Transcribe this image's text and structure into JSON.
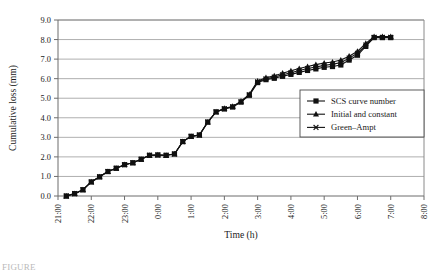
{
  "chart_data": {
    "type": "line",
    "title": "",
    "xlabel": "Time (h)",
    "ylabel": "Cumulative loss (mm)",
    "xlim": [
      0,
      11
    ],
    "ylim": [
      0,
      9
    ],
    "grid": true,
    "legend_position": "center-right",
    "x_tick_labels": [
      "21:00",
      "22:00",
      "23:00",
      "0:00",
      "1:00",
      "2:00",
      "3:00",
      "4:00",
      "5:00",
      "6:00",
      "7:00",
      "8:00"
    ],
    "x_tick_values": [
      0,
      1,
      2,
      3,
      4,
      5,
      6,
      7,
      8,
      9,
      10,
      11
    ],
    "y_tick_labels": [
      "0.0",
      "1.0",
      "2.0",
      "3.0",
      "4.0",
      "5.0",
      "6.0",
      "7.0",
      "8.0",
      "9.0"
    ],
    "y_tick_values": [
      0,
      1,
      2,
      3,
      4,
      5,
      6,
      7,
      8,
      9
    ],
    "x": [
      0.25,
      0.5,
      0.75,
      1.0,
      1.25,
      1.5,
      1.75,
      2.0,
      2.25,
      2.5,
      2.75,
      3.0,
      3.25,
      3.5,
      3.75,
      4.0,
      4.25,
      4.5,
      4.75,
      5.0,
      5.25,
      5.5,
      5.75,
      6.0,
      6.25,
      6.5,
      6.75,
      7.0,
      7.25,
      7.5,
      7.75,
      8.0,
      8.25,
      8.5,
      8.75,
      9.0,
      9.25,
      9.5,
      9.75,
      10.0
    ],
    "series": [
      {
        "name": "SCS curve number",
        "marker": "square",
        "values": [
          0.0,
          0.12,
          0.32,
          0.72,
          0.98,
          1.25,
          1.42,
          1.6,
          1.7,
          1.88,
          2.08,
          2.1,
          2.08,
          2.15,
          2.78,
          3.05,
          3.12,
          3.78,
          4.3,
          4.45,
          4.55,
          4.8,
          5.15,
          5.8,
          5.95,
          6.02,
          6.12,
          6.22,
          6.32,
          6.42,
          6.5,
          6.58,
          6.62,
          6.7,
          6.95,
          7.2,
          7.65,
          8.1,
          8.1,
          8.1
        ]
      },
      {
        "name": "Initial and constant",
        "marker": "triangle",
        "values": [
          0.0,
          0.12,
          0.32,
          0.72,
          0.98,
          1.25,
          1.42,
          1.6,
          1.7,
          1.88,
          2.08,
          2.1,
          2.08,
          2.15,
          2.78,
          3.05,
          3.12,
          3.78,
          4.3,
          4.48,
          4.58,
          4.85,
          5.2,
          5.88,
          6.05,
          6.15,
          6.28,
          6.4,
          6.52,
          6.62,
          6.72,
          6.8,
          6.85,
          6.95,
          7.15,
          7.4,
          7.8,
          8.15,
          8.15,
          8.15
        ]
      },
      {
        "name": "Green–Ampt",
        "marker": "x",
        "values": [
          0.0,
          0.12,
          0.32,
          0.72,
          0.98,
          1.25,
          1.42,
          1.6,
          1.7,
          1.88,
          2.08,
          2.1,
          2.08,
          2.15,
          2.78,
          3.05,
          3.12,
          3.78,
          4.3,
          4.46,
          4.56,
          4.82,
          5.18,
          5.84,
          6.0,
          6.08,
          6.2,
          6.3,
          6.42,
          6.52,
          6.6,
          6.68,
          6.74,
          6.82,
          7.05,
          7.3,
          7.72,
          8.12,
          8.12,
          8.12
        ]
      }
    ]
  },
  "legend": {
    "entries": [
      {
        "label": "SCS curve number"
      },
      {
        "label": "Initial and constant"
      },
      {
        "label": "Green–Ampt"
      }
    ]
  },
  "caption": {
    "text": "FIGURE"
  }
}
